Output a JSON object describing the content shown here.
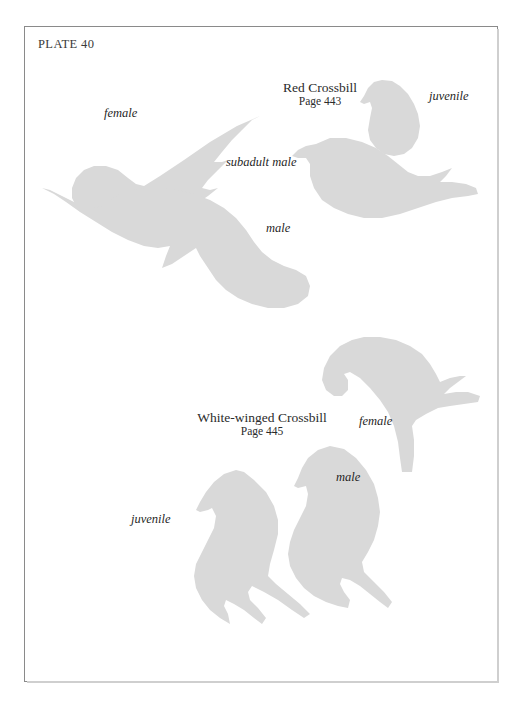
{
  "plate": {
    "label": "PLATE 40",
    "background_color": "#ffffff",
    "border_color": "#8a8a8a",
    "silhouette_color": "#d9d9d9"
  },
  "species": [
    {
      "name": "Red Crossbill",
      "page": "Page 443",
      "figures": [
        {
          "label": "female"
        },
        {
          "label": "juvenile"
        },
        {
          "label": "subadult male"
        },
        {
          "label": "male"
        }
      ]
    },
    {
      "name": "White-winged Crossbill",
      "page": "Page 445",
      "figures": [
        {
          "label": "female"
        },
        {
          "label": "male"
        },
        {
          "label": "juvenile"
        }
      ]
    }
  ],
  "labels": {
    "red_female": "female",
    "red_juvenile": "juvenile",
    "red_subadult_male": "subadult male",
    "red_male": "male",
    "white_female": "female",
    "white_male": "male",
    "white_juvenile": "juvenile"
  }
}
